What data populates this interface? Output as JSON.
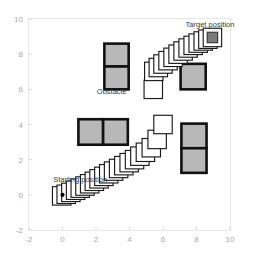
{
  "chart_data": {
    "type": "scatter",
    "title": "",
    "xlabel": "",
    "ylabel": "",
    "xlim": [
      -2,
      10
    ],
    "ylim": [
      -2,
      10
    ],
    "grid": false,
    "legend": null,
    "xticks": [
      "-2",
      "0",
      "2",
      "4",
      "6",
      "8",
      "10"
    ],
    "xtick_values": [
      -2,
      0,
      2,
      4,
      6,
      8,
      10
    ],
    "yticks": [
      "-2",
      "0",
      "2",
      "4",
      "6",
      "8",
      "10"
    ],
    "ytick_values": [
      -2,
      0,
      2,
      4,
      6,
      8,
      10
    ],
    "annotations": [
      {
        "text": "Target position",
        "x": 7.35,
        "y": 9.55
      },
      {
        "text": "Obstacle",
        "x": 2.05,
        "y": 5.75
      },
      {
        "text": "Starting position",
        "x": -0.55,
        "y": 0.72
      }
    ],
    "obstacles": [
      {
        "name": "obstacle-upper-left",
        "x": 2.5,
        "y": 6.0,
        "w": 1.45,
        "h": 2.6,
        "rows": 2,
        "cols": 1,
        "fill": "#b8b8b8",
        "edge": "#111111"
      },
      {
        "name": "obstacle-upper-right",
        "x": 7.05,
        "y": 6.0,
        "w": 1.5,
        "h": 1.45,
        "rows": 1,
        "cols": 1,
        "fill": "#b8b8b8",
        "edge": "#111111"
      },
      {
        "name": "obstacle-lower-left",
        "x": 0.95,
        "y": 2.85,
        "w": 2.95,
        "h": 1.45,
        "rows": 1,
        "cols": 2,
        "fill": "#b8b8b8",
        "edge": "#111111"
      },
      {
        "name": "obstacle-lower-right",
        "x": 7.1,
        "y": 1.25,
        "w": 1.5,
        "h": 2.8,
        "rows": 2,
        "cols": 1,
        "fill": "#b8b8b8",
        "edge": "#111111"
      }
    ],
    "series": [
      {
        "name": "lower-path",
        "marker": "square-outline",
        "fill": "#ffffff",
        "edge": "#1a1a1a",
        "size": 1.1,
        "x": [
          -0.05,
          0.22,
          0.5,
          0.78,
          1.06,
          1.34,
          1.62,
          1.9,
          2.18,
          2.47,
          2.76,
          3.05,
          3.35,
          3.66,
          3.98,
          4.3,
          4.62,
          4.95,
          5.3,
          5.65,
          6.0
        ],
        "y": [
          -0.06,
          0.03,
          0.14,
          0.26,
          0.38,
          0.5,
          0.63,
          0.77,
          0.91,
          1.05,
          1.2,
          1.35,
          1.5,
          1.66,
          1.83,
          2.0,
          2.2,
          2.42,
          2.68,
          3.15,
          4.0
        ]
      },
      {
        "name": "upper-path",
        "marker": "square-outline",
        "fill": "#ffffff",
        "edge": "#1a1a1a",
        "size": 1.1,
        "x": [
          5.42,
          5.45,
          5.72,
          6.0,
          6.3,
          6.6,
          6.9,
          7.2,
          7.5,
          7.8,
          8.1,
          8.4,
          8.68,
          8.95
        ],
        "y": [
          6.0,
          7.02,
          7.24,
          7.44,
          7.63,
          7.82,
          8.0,
          8.18,
          8.35,
          8.5,
          8.63,
          8.75,
          8.85,
          8.95
        ]
      }
    ],
    "start_marker": {
      "name": "start-dot",
      "x": 0.0,
      "y": 0.0,
      "shape": "dot",
      "color": "#000000"
    },
    "target_marker": {
      "name": "target-square",
      "x": 8.95,
      "y": 8.95,
      "shape": "filled-square",
      "color": "#7a7a7a"
    },
    "colors": {
      "background": "#ffffff",
      "frame": "#e8e8e8",
      "tick_text": "#a9a9a9",
      "annotation_text": "#3a3a3a",
      "obstacle_fill": "#b8b8b8",
      "obstacle_edge": "#111111",
      "path_fill": "#ffffff",
      "path_edge": "#1a1a1a"
    }
  }
}
